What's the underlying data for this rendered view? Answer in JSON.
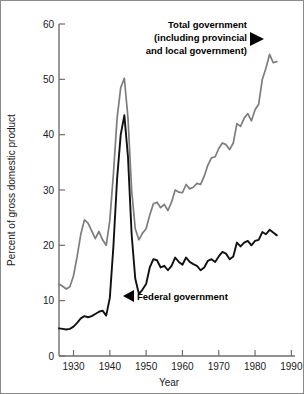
{
  "chart_data": {
    "type": "line",
    "title": "",
    "xlabel": "Year",
    "ylabel": "Percent of gross domestic product",
    "xlim": [
      1926,
      1991
    ],
    "ylim": [
      0,
      60
    ],
    "xticks": [
      1930,
      1940,
      1950,
      1960,
      1970,
      1980,
      1990
    ],
    "xtick_labels": [
      "1930",
      "1940",
      "1950",
      "1960",
      "1970",
      "1980",
      "1990"
    ],
    "yticks": [
      0,
      10,
      20,
      30,
      40,
      50,
      60
    ],
    "ytick_labels": [
      "0",
      "10",
      "20",
      "30",
      "40",
      "50",
      "60"
    ],
    "grid": false,
    "legend_position": "inline-annotations",
    "annotations": [
      {
        "name": "total-government",
        "lines": [
          "Total government",
          "(including provincial",
          "and local government)"
        ],
        "text": "Total government (including provincial and local government)",
        "arrow": "right",
        "points_to_year": 1982,
        "points_to_value": 54.5
      },
      {
        "name": "federal-government",
        "lines": [
          "Federal government"
        ],
        "text": "Federal government",
        "arrow": "left",
        "points_to_year": 1946,
        "points_to_value": 11.5
      }
    ],
    "series": [
      {
        "name": "Total government (including provincial and local government)",
        "color": "#7d7d7d",
        "x": [
          1926,
          1927,
          1928,
          1929,
          1930,
          1931,
          1932,
          1933,
          1934,
          1935,
          1936,
          1937,
          1938,
          1939,
          1940,
          1941,
          1942,
          1943,
          1944,
          1945,
          1946,
          1947,
          1948,
          1949,
          1950,
          1951,
          1952,
          1953,
          1954,
          1955,
          1956,
          1957,
          1958,
          1959,
          1960,
          1961,
          1962,
          1963,
          1964,
          1965,
          1966,
          1967,
          1968,
          1969,
          1970,
          1971,
          1972,
          1973,
          1974,
          1975,
          1976,
          1977,
          1978,
          1979,
          1980,
          1981,
          1982,
          1983,
          1984,
          1985,
          1986
        ],
        "values": [
          13.0,
          12.6,
          12.1,
          12.5,
          14.5,
          18.0,
          22.0,
          24.6,
          24.0,
          22.6,
          21.2,
          22.5,
          21.0,
          20.0,
          24.5,
          33.0,
          43.0,
          48.5,
          50.2,
          43.0,
          30.0,
          23.0,
          21.0,
          22.2,
          23.0,
          25.5,
          27.5,
          27.8,
          26.8,
          27.4,
          26.3,
          27.8,
          30.0,
          29.6,
          29.5,
          31.0,
          30.2,
          30.5,
          31.2,
          31.0,
          32.5,
          34.5,
          35.8,
          36.0,
          37.5,
          38.5,
          38.2,
          37.3,
          38.5,
          42.0,
          41.5,
          43.0,
          43.8,
          42.5,
          44.5,
          45.5,
          50.0,
          52.0,
          54.5,
          53.0,
          53.2
        ]
      },
      {
        "name": "Federal government",
        "color": "#111111",
        "x": [
          1926,
          1927,
          1928,
          1929,
          1930,
          1931,
          1932,
          1933,
          1934,
          1935,
          1936,
          1937,
          1938,
          1939,
          1940,
          1941,
          1942,
          1943,
          1944,
          1945,
          1946,
          1947,
          1948,
          1949,
          1950,
          1951,
          1952,
          1953,
          1954,
          1955,
          1956,
          1957,
          1958,
          1959,
          1960,
          1961,
          1962,
          1963,
          1964,
          1965,
          1966,
          1967,
          1968,
          1969,
          1970,
          1971,
          1972,
          1973,
          1974,
          1975,
          1976,
          1977,
          1978,
          1979,
          1980,
          1981,
          1982,
          1983,
          1984,
          1985,
          1986
        ],
        "values": [
          5.0,
          4.9,
          4.8,
          4.9,
          5.3,
          6.0,
          6.8,
          7.2,
          7.0,
          7.2,
          7.6,
          8.0,
          8.2,
          7.3,
          10.5,
          20.0,
          32.0,
          40.0,
          43.5,
          36.0,
          22.0,
          14.0,
          11.2,
          12.0,
          13.0,
          16.0,
          17.5,
          17.3,
          16.0,
          16.3,
          15.5,
          16.3,
          17.8,
          17.0,
          16.5,
          17.8,
          17.0,
          16.6,
          16.3,
          15.5,
          16.0,
          17.2,
          17.5,
          17.0,
          18.0,
          18.8,
          18.5,
          17.5,
          18.0,
          20.5,
          19.8,
          20.5,
          20.8,
          20.0,
          20.8,
          21.0,
          22.4,
          22.0,
          22.8,
          22.3,
          21.8
        ]
      }
    ]
  }
}
